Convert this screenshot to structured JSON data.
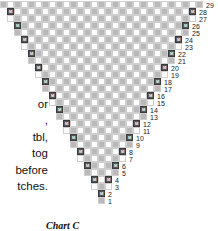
{
  "caption": {
    "text": "Chart C"
  },
  "instructions": {
    "lines": [
      "or",
      ",",
      "tbl,",
      "tog",
      "before",
      "tches."
    ]
  },
  "chart": {
    "title": "Chart C",
    "cell_size_px": 7,
    "top_row_number": 29,
    "bottom_row_number": 1,
    "marker_symbol": "M",
    "colors": {
      "shaded_cell": "#b9b9b9",
      "blank_cell": "#ffffff",
      "grid_line": "#cfcfcf",
      "marker_fill": "#58585a",
      "marker_text": "#ffffff",
      "number_text": "#1a1a1a"
    },
    "row_numbers": [
      29,
      28,
      27,
      26,
      25,
      24,
      23,
      22,
      21,
      20,
      19,
      18,
      17,
      16,
      15,
      14,
      13,
      12,
      11,
      10,
      9,
      8,
      7,
      6,
      5,
      4,
      3,
      2,
      1
    ],
    "rows": [
      {
        "number": 29,
        "left": 0,
        "width": 29,
        "marker_cols": []
      },
      {
        "number": 28,
        "left": 1,
        "width": 27,
        "marker_cols": [
          0,
          26
        ]
      },
      {
        "number": 27,
        "left": 1,
        "width": 27,
        "marker_cols": []
      },
      {
        "number": 26,
        "left": 2,
        "width": 25,
        "marker_cols": [
          0,
          24
        ]
      },
      {
        "number": 25,
        "left": 2,
        "width": 25,
        "marker_cols": []
      },
      {
        "number": 24,
        "left": 3,
        "width": 23,
        "marker_cols": [
          0,
          22
        ]
      },
      {
        "number": 23,
        "left": 3,
        "width": 23,
        "marker_cols": []
      },
      {
        "number": 22,
        "left": 4,
        "width": 21,
        "marker_cols": [
          0,
          20
        ]
      },
      {
        "number": 21,
        "left": 4,
        "width": 21,
        "marker_cols": []
      },
      {
        "number": 20,
        "left": 5,
        "width": 19,
        "marker_cols": [
          0,
          18
        ]
      },
      {
        "number": 19,
        "left": 5,
        "width": 19,
        "marker_cols": []
      },
      {
        "number": 18,
        "left": 6,
        "width": 17,
        "marker_cols": [
          0,
          16
        ]
      },
      {
        "number": 17,
        "left": 6,
        "width": 17,
        "marker_cols": []
      },
      {
        "number": 16,
        "left": 7,
        "width": 15,
        "marker_cols": [
          0,
          14
        ]
      },
      {
        "number": 15,
        "left": 7,
        "width": 15,
        "marker_cols": []
      },
      {
        "number": 14,
        "left": 8,
        "width": 13,
        "marker_cols": [
          0,
          12
        ]
      },
      {
        "number": 13,
        "left": 8,
        "width": 13,
        "marker_cols": []
      },
      {
        "number": 12,
        "left": 9,
        "width": 11,
        "marker_cols": [
          0,
          10
        ]
      },
      {
        "number": 11,
        "left": 9,
        "width": 11,
        "marker_cols": []
      },
      {
        "number": 10,
        "left": 10,
        "width": 9,
        "marker_cols": [
          0,
          8
        ]
      },
      {
        "number": 9,
        "left": 10,
        "width": 9,
        "marker_cols": []
      },
      {
        "number": 8,
        "left": 11,
        "width": 7,
        "marker_cols": [
          0,
          6
        ]
      },
      {
        "number": 7,
        "left": 11,
        "width": 7,
        "marker_cols": []
      },
      {
        "number": 6,
        "left": 12,
        "width": 5,
        "marker_cols": [
          0,
          4
        ]
      },
      {
        "number": 5,
        "left": 12,
        "width": 5,
        "marker_cols": []
      },
      {
        "number": 4,
        "left": 13,
        "width": 3,
        "marker_cols": [
          0,
          2
        ]
      },
      {
        "number": 3,
        "left": 13,
        "width": 3,
        "marker_cols": []
      },
      {
        "number": 2,
        "left": 14,
        "width": 1,
        "marker_cols": [
          0
        ]
      },
      {
        "number": 1,
        "left": 14,
        "width": 1,
        "marker_cols": []
      }
    ]
  }
}
